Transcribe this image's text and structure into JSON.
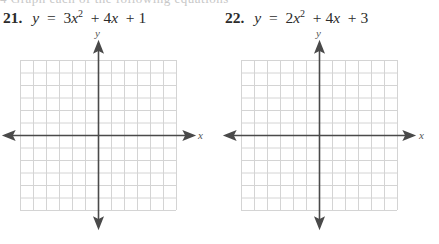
{
  "page": {
    "cut_text": "4 Graph each of the following equations"
  },
  "problems": [
    {
      "number": "21.",
      "equation": {
        "lhs": "y",
        "eq": "=",
        "coef_a": "3",
        "var": "x",
        "exp": "2",
        "term2": "+ 4",
        "term2_var": "x",
        "term3": "+ 1",
        "full_text": "y = 3x^2 + 4x + 1"
      },
      "graph": {
        "x_label": "x",
        "y_label": "y",
        "grid_columns": 12,
        "grid_rows": 12
      }
    },
    {
      "number": "22.",
      "equation": {
        "lhs": "y",
        "eq": "=",
        "coef_a": "2",
        "var": "x",
        "exp": "2",
        "term2": "+ 4",
        "term2_var": "x",
        "term3": "+ 3",
        "full_text": "y = 2x^2 + 4x + 3"
      },
      "graph": {
        "x_label": "x",
        "y_label": "y",
        "grid_columns": 12,
        "grid_rows": 12
      }
    }
  ],
  "colors": {
    "grid": "#d4d4d4",
    "axis": "#4a4a4a",
    "text": "#2b2b2b"
  }
}
